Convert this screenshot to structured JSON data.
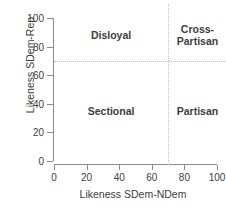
{
  "chart_data": {
    "type": "scatter",
    "title": "",
    "xlabel": "Likeness SDem-NDem",
    "ylabel": "Likeness SDem-Rep",
    "xlim": [
      0,
      100
    ],
    "ylim": [
      0,
      100
    ],
    "xticks": [
      0,
      20,
      40,
      60,
      80,
      100
    ],
    "yticks": [
      0,
      20,
      40,
      60,
      80,
      100
    ],
    "xticklabels": [
      "0",
      "20",
      "40",
      "60",
      "80",
      "100"
    ],
    "yticklabels": [
      "0",
      "20",
      "40",
      "60",
      "80",
      "100"
    ],
    "grid": false,
    "legend": null,
    "series": [],
    "threshold_lines": [
      {
        "orientation": "horizontal",
        "value": 70,
        "style": "dotted",
        "color": "#bdbdbd"
      },
      {
        "orientation": "vertical",
        "value": 70,
        "style": "dotted",
        "color": "#bdbdbd"
      }
    ],
    "annotations": [
      {
        "text": "Disloyal",
        "x": 35,
        "y": 88,
        "quadrant": "top-left"
      },
      {
        "text": "Cross-\nPartisan",
        "x": 88,
        "y": 88,
        "quadrant": "top-right"
      },
      {
        "text": "Sectional",
        "x": 35,
        "y": 35,
        "quadrant": "bottom-left"
      },
      {
        "text": "Partisan",
        "x": 88,
        "y": 35,
        "quadrant": "bottom-right"
      }
    ]
  },
  "colors": {
    "axis": "#8a8a8a",
    "text": "#3d3d3d",
    "guide": "#bdbdbd",
    "background": "#ffffff"
  }
}
